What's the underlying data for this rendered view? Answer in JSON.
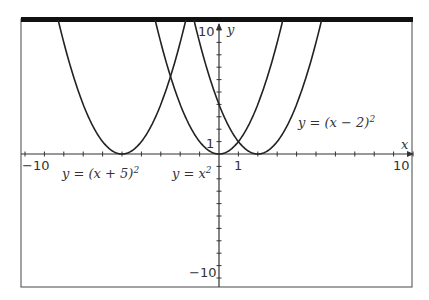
{
  "chart_data": {
    "type": "line",
    "title": "",
    "xlabel": "x",
    "ylabel": "y",
    "xlim": [
      -10,
      10
    ],
    "ylim": [
      -10,
      10
    ],
    "grid": false,
    "ticks": {
      "x": [
        -10,
        1,
        10
      ],
      "y": [
        -10,
        1,
        10
      ],
      "x_tick_labels": [
        "−10",
        "1",
        "10"
      ],
      "y_tick_labels": [
        "−10",
        "1",
        "10"
      ]
    },
    "series": [
      {
        "name": "y = (x + 5)^2",
        "label": "y = (x + 5)",
        "exp": "2",
        "shift": -5
      },
      {
        "name": "y = x^2",
        "label": "y = x",
        "exp": "2",
        "shift": 0
      },
      {
        "name": "y = (x − 2)^2",
        "label": "y = (x − 2)",
        "exp": "2",
        "shift": 2
      }
    ],
    "annotations": [
      {
        "text": "y = (x + 5)^2",
        "near_x": -5
      },
      {
        "text": "y = x^2",
        "near_x": 0
      },
      {
        "text": "y = (x − 2)^2",
        "near_x": 4
      }
    ]
  }
}
